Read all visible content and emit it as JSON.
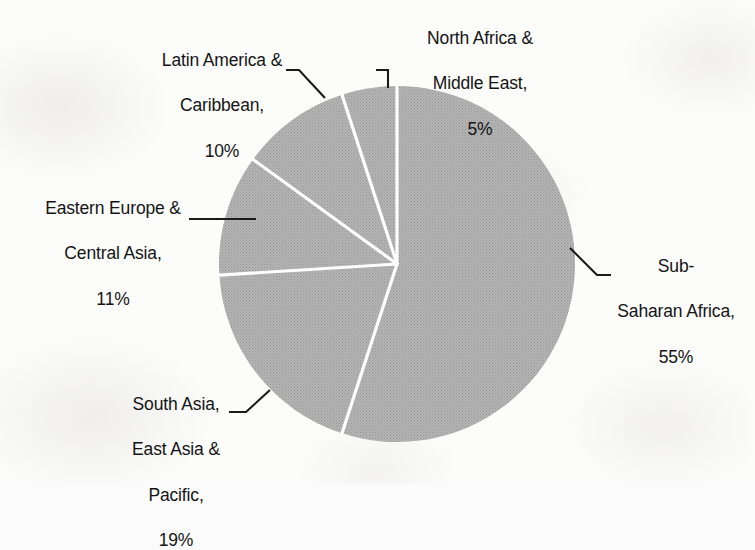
{
  "chart_data": {
    "type": "pie",
    "title": "",
    "subtitle": "",
    "xlabel": "",
    "ylabel": "",
    "units": "percent",
    "legend_position": "none",
    "grid": false,
    "start_angle_deg": 0,
    "direction": "clockwise",
    "categories": [
      "Sub-Saharan Africa",
      "South Asia, East Asia & Pacific",
      "Eastern Europe & Central Asia",
      "Latin America & Caribbean",
      "North Africa & Middle East"
    ],
    "values": [
      55,
      19,
      11,
      10,
      5
    ],
    "slices": [
      {
        "name": "Sub-Saharan Africa",
        "value": 55,
        "value_label": "55%",
        "start_deg": 0,
        "end_deg": 198,
        "fill": "#a9a9a9"
      },
      {
        "name": "South Asia, East Asia & Pacific",
        "value": 19,
        "value_label": "19%",
        "start_deg": 198,
        "end_deg": 266.4,
        "fill": "#a9a9a9"
      },
      {
        "name": "Eastern Europe & Central Asia",
        "value": 11,
        "value_label": "11%",
        "start_deg": 266.4,
        "end_deg": 306,
        "fill": "#a9a9a9"
      },
      {
        "name": "Latin America & Caribbean",
        "value": 10,
        "value_label": "10%",
        "start_deg": 306,
        "end_deg": 342,
        "fill": "#a9a9a9"
      },
      {
        "name": "North Africa & Middle East",
        "value": 5,
        "value_label": "5%",
        "start_deg": 342,
        "end_deg": 360,
        "fill": "#a9a9a9"
      }
    ]
  },
  "labels": {
    "north_africa": {
      "line1": "North Africa &",
      "line2": "Middle East,",
      "line3": "5%"
    },
    "latin_america": {
      "line1": "Latin America &",
      "line2": "Caribbean,",
      "line3": "10%"
    },
    "eastern_europe": {
      "line1": "Eastern Europe &",
      "line2": "Central Asia,",
      "line3": "11%"
    },
    "south_asia": {
      "line1": "South Asia,",
      "line2": "East Asia &",
      "line3": "Pacific,",
      "line4": "19%"
    },
    "sub_saharan": {
      "line1": "Sub-",
      "line2": "Saharan Africa,",
      "line3": "55%"
    }
  },
  "colors": {
    "slice_fill": "#a9a9a9",
    "slice_divider": "#ffffff",
    "leader_line": "#1a1a1a",
    "text": "#141414",
    "background": "#fbfbfb"
  }
}
